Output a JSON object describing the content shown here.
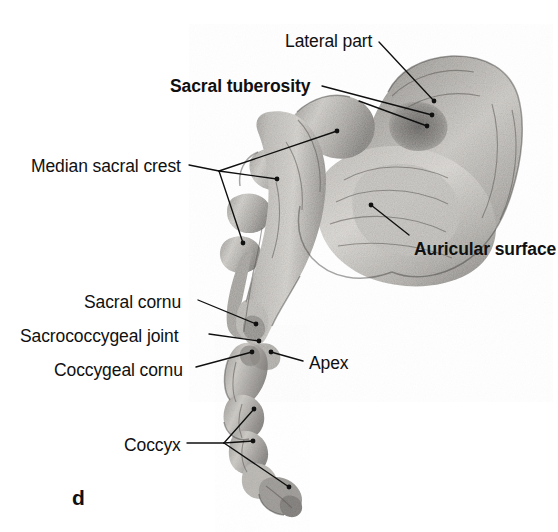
{
  "figure": {
    "panel_letter": "d",
    "background_color": "#ffffff",
    "ink_color": "#101010",
    "bone_tone_light": "#d9d6d1",
    "bone_tone_mid": "#a8a5a0",
    "bone_tone_dark": "#6d6a66",
    "bone_tone_shadow": "#4a4845"
  },
  "labels": [
    {
      "id": "lateral-part",
      "text": "Lateral part",
      "bold": false,
      "x": 285,
      "y": 33,
      "align": "left"
    },
    {
      "id": "sacral-tuberosity",
      "text": "Sacral tuberosity",
      "bold": true,
      "x": 170,
      "y": 78,
      "align": "left"
    },
    {
      "id": "median-sacral-crest",
      "text": "Median sacral crest",
      "bold": false,
      "x": 31,
      "y": 158,
      "align": "left"
    },
    {
      "id": "auricular-surface",
      "text": "Auricular surface",
      "bold": true,
      "x": 414,
      "y": 241,
      "align": "left"
    },
    {
      "id": "sacral-cornu",
      "text": "Sacral cornu",
      "bold": false,
      "x": 84,
      "y": 294,
      "align": "left"
    },
    {
      "id": "sacrococcygeal-joint",
      "text": "Sacrococcygeal joint",
      "bold": false,
      "x": 20,
      "y": 328,
      "align": "left"
    },
    {
      "id": "coccygeal-cornu",
      "text": "Coccygeal cornu",
      "bold": false,
      "x": 54,
      "y": 362,
      "align": "left"
    },
    {
      "id": "apex",
      "text": "Apex",
      "bold": false,
      "x": 309,
      "y": 355,
      "align": "left"
    },
    {
      "id": "coccyx",
      "text": "Coccyx",
      "bold": false,
      "x": 124,
      "y": 437,
      "align": "left"
    }
  ],
  "leader_lines": [
    {
      "id": "leader-lateral-part",
      "for": "lateral-part",
      "path": "M 379 42 L 434 101",
      "endpoints": [
        [
          434,
          101
        ]
      ]
    },
    {
      "id": "leader-sacral-tuberosity",
      "for": "sacral-tuberosity",
      "path": "M 322 86 L 432 115",
      "endpoints": [
        [
          432,
          115
        ]
      ]
    },
    {
      "id": "leader-sacral-tuberosity-b",
      "for": "sacral-tuberosity",
      "path": "M 359 101 L 427 126",
      "endpoints": [
        [
          427,
          126
        ]
      ]
    },
    {
      "id": "leader-median-sacral-crest",
      "for": "median-sacral-crest",
      "path": "M 189 165 L 219 171",
      "endpoints": []
    },
    {
      "id": "leader-median-sacral-crest-b1",
      "for": "median-sacral-crest",
      "path": "M 219 171 L 337 131",
      "endpoints": [
        [
          337,
          131
        ]
      ]
    },
    {
      "id": "leader-median-sacral-crest-b2",
      "for": "median-sacral-crest",
      "path": "M 219 171 L 277 179",
      "endpoints": [
        [
          277,
          179
        ]
      ]
    },
    {
      "id": "leader-median-sacral-crest-b3",
      "for": "median-sacral-crest",
      "path": "M 219 171 L 243 243",
      "endpoints": [
        [
          243,
          243
        ]
      ]
    },
    {
      "id": "leader-auricular-surface",
      "for": "auricular-surface",
      "path": "M 409 235 L 371 205",
      "endpoints": [
        [
          371,
          205
        ]
      ]
    },
    {
      "id": "leader-sacral-cornu",
      "for": "sacral-cornu",
      "path": "M 198 300 L 256 324",
      "endpoints": [
        [
          256,
          324
        ]
      ]
    },
    {
      "id": "leader-sacrococcygeal-joint",
      "for": "sacrococcygeal-joint",
      "path": "M 209 334 L 259 341",
      "endpoints": [
        [
          259,
          341
        ]
      ]
    },
    {
      "id": "leader-coccygeal-cornu",
      "for": "coccygeal-cornu",
      "path": "M 196 367 L 252 352",
      "endpoints": [
        [
          252,
          352
        ]
      ]
    },
    {
      "id": "leader-apex",
      "for": "apex",
      "path": "M 303 361 L 271 352",
      "endpoints": [
        [
          271,
          352
        ]
      ]
    },
    {
      "id": "leader-coccyx",
      "for": "coccyx",
      "path": "M 187 443 L 224 443",
      "endpoints": []
    },
    {
      "id": "leader-coccyx-b1",
      "for": "coccyx",
      "path": "M 224 443 L 254 409",
      "endpoints": [
        [
          254,
          409
        ]
      ]
    },
    {
      "id": "leader-coccyx-b2",
      "for": "coccyx",
      "path": "M 224 443 L 253 441",
      "endpoints": [
        [
          253,
          441
        ]
      ]
    },
    {
      "id": "leader-coccyx-b3",
      "for": "coccyx",
      "path": "M 224 443 L 289 487",
      "endpoints": [
        [
          289,
          487
        ]
      ]
    }
  ]
}
